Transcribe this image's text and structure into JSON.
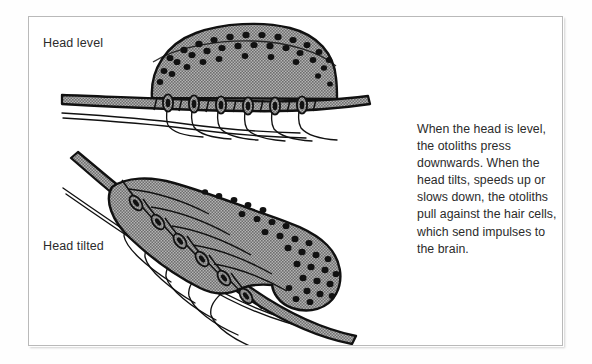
{
  "figure": {
    "title_alt": "Otolith organ diagram: head level versus head tilted",
    "background_color": "#ffffff",
    "frame_border_color": "#b9b9b9",
    "ink_color": "#111111",
    "tissue_fill_color": "#9a9a9a",
    "otolith_dot_color": "#111111"
  },
  "labels": {
    "head_level": "Head level",
    "head_tilted": "Head tilted"
  },
  "caption": {
    "text": "When the head is level, the otoliths press downwards. When the head tilts, speeds up or slows down, the otoliths pull against the hair cells, which send impulses to the brain."
  },
  "diagram_level": {
    "name": "head-level-panel",
    "parts": {
      "otolith_membrane": "dome-shaped otolithic membrane",
      "otolith_count": 34,
      "hair_cell_count": 6,
      "epithelium_band": "horizontal sensory epithelium band",
      "nerve_fibre_count": 6
    }
  },
  "diagram_tilted": {
    "name": "head-tilted-panel",
    "parts": {
      "otolith_membrane": "displaced otolithic membrane sliding down-slope",
      "otolith_count": 30,
      "hair_cell_count": 6,
      "epithelium_band": "tilted sensory epithelium band",
      "nerve_fibre_count": 6
    }
  }
}
